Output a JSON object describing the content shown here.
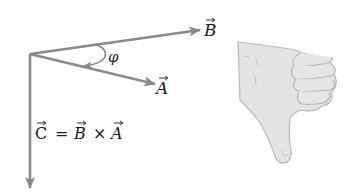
{
  "diagram": {
    "colors": {
      "vector": "#8a8a8a",
      "text": "#1a1a1a",
      "hand_fill": "#e4e4e4",
      "hand_outline": "#b9b9b9",
      "background": "#ffffff"
    },
    "vectors": [
      {
        "id": "B",
        "label": "B",
        "from": [
          30,
          54
        ],
        "to": [
          200,
          30
        ]
      },
      {
        "id": "A",
        "label": "A",
        "from": [
          30,
          54
        ],
        "to": [
          155,
          84
        ]
      },
      {
        "id": "C",
        "label": "C",
        "from": [
          30,
          54
        ],
        "to": [
          30,
          188
        ]
      }
    ],
    "angle": {
      "label": "φ",
      "between": [
        "B",
        "A"
      ]
    },
    "equation": {
      "lhs": "C",
      "equals": "=",
      "term1": "B",
      "operator": "×",
      "term2": "A"
    },
    "hand": {
      "gesture": "thumb-down",
      "meaning": "right-hand rule indicating C points downward"
    }
  }
}
